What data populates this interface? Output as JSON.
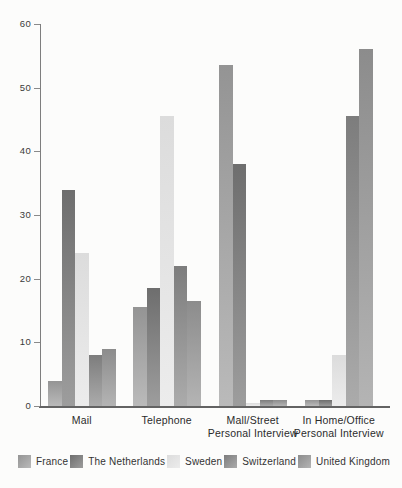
{
  "figure": {
    "background_color": "#fcfcfb",
    "axis_color": "#7e7e7e",
    "baseline_color": "#636363",
    "text_color": "#2b2b2b"
  },
  "chart_data": {
    "type": "bar",
    "title": "",
    "xlabel": "",
    "ylabel": "",
    "ylim": [
      0,
      60
    ],
    "yticks": [
      0,
      10,
      20,
      30,
      40,
      50,
      60
    ],
    "grid": false,
    "legend_position": "bottom",
    "categories": [
      "Mail",
      "Telephone",
      "Mall/Street\nPersonal Interview",
      "In Home/Office\nPersonal Interview"
    ],
    "series": [
      {
        "name": "France",
        "color_top": "#949494",
        "color_bottom": "#bababa",
        "values": [
          4,
          15.5,
          53.5,
          1
        ]
      },
      {
        "name": "The Netherlands",
        "color_top": "#6e6e6e",
        "color_bottom": "#9d9d9d",
        "values": [
          34,
          18.5,
          38,
          1
        ]
      },
      {
        "name": "Sweden",
        "color_top": "#dcdcdc",
        "color_bottom": "#ececec",
        "values": [
          24,
          45.5,
          0.5,
          8
        ]
      },
      {
        "name": "Switzerland",
        "color_top": "#7d7d7d",
        "color_bottom": "#ababab",
        "values": [
          8,
          22,
          1,
          45.5
        ]
      },
      {
        "name": "United Kingdom",
        "color_top": "#8c8c8c",
        "color_bottom": "#b4b4b4",
        "values": [
          9,
          16.5,
          1,
          56
        ]
      }
    ]
  }
}
